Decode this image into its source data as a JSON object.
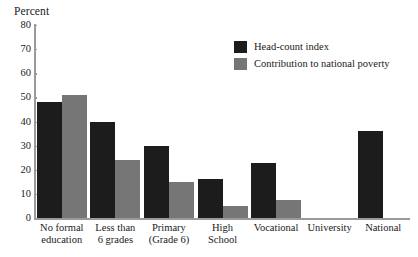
{
  "chart_data": {
    "type": "bar",
    "title": "",
    "subtitle": "",
    "xlabel": "",
    "ylabel": "Percent",
    "ylim": [
      0,
      80
    ],
    "yticks": [
      0,
      10,
      20,
      30,
      40,
      50,
      60,
      70,
      80
    ],
    "grid": false,
    "legend_position": "upper-right-inside",
    "categories": [
      "No formal education",
      "Less than 6 grades",
      "Primary (Grade 6)",
      "High School",
      "Vocational",
      "University",
      "National"
    ],
    "category_lines": [
      [
        "No formal",
        "education"
      ],
      [
        "Less than",
        "6 grades"
      ],
      [
        "Primary",
        "(Grade 6)"
      ],
      [
        "High",
        "School"
      ],
      [
        "Vocational"
      ],
      [
        "University"
      ],
      [
        "National"
      ]
    ],
    "series": [
      {
        "name": "Head-count index",
        "color": "#1c1c1c",
        "values": [
          48,
          40,
          30,
          16,
          23,
          0,
          36
        ]
      },
      {
        "name": "Contribution to national poverty",
        "color": "#767676",
        "values": [
          51,
          24,
          15,
          5,
          7.5,
          0,
          0
        ]
      }
    ]
  },
  "colors": {
    "background": "#ffffff",
    "axis": "#9a9a9a",
    "text": "#1a1a1a",
    "series_0": "#1c1c1c",
    "series_1": "#767676"
  }
}
